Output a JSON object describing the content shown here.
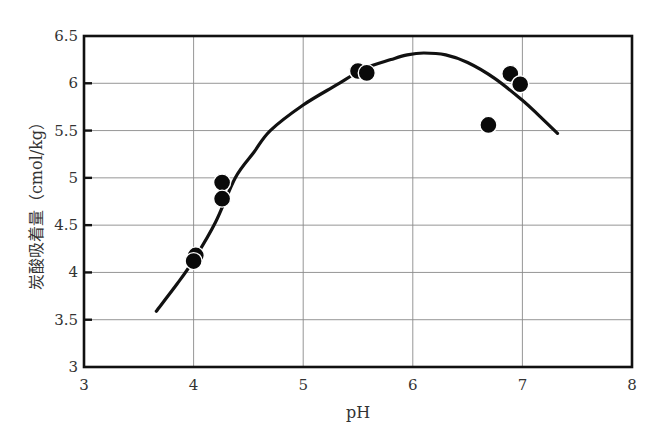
{
  "chart_data": {
    "type": "scatter",
    "title": "",
    "xlabel": "pH",
    "ylabel": "炭酸吸着量 (cmol/kg)",
    "ylabel_parts": {
      "main": "炭酸吸着量",
      "unit": "（cmol/kg）"
    },
    "xlim": [
      3,
      8
    ],
    "ylim": [
      3,
      6.5
    ],
    "x_ticks": [
      3,
      4,
      5,
      6,
      7,
      8
    ],
    "x_tick_labels": [
      "3",
      "4",
      "5",
      "6",
      "7",
      "8"
    ],
    "y_ticks": [
      3,
      3.5,
      4,
      4.5,
      5,
      5.5,
      6,
      6.5
    ],
    "y_tick_labels": [
      "3",
      "3.5",
      "4",
      "4.5",
      "5",
      "5.5",
      "6",
      "6.5"
    ],
    "grid": true,
    "legend": null,
    "series": [
      {
        "name": "measured",
        "kind": "scatter",
        "marker": "filled-circle",
        "color": "#0a0a0a",
        "points": [
          {
            "x": 4.02,
            "y": 4.18
          },
          {
            "x": 4.0,
            "y": 4.12
          },
          {
            "x": 4.26,
            "y": 4.95
          },
          {
            "x": 4.26,
            "y": 4.78
          },
          {
            "x": 5.5,
            "y": 6.13
          },
          {
            "x": 5.58,
            "y": 6.11
          },
          {
            "x": 6.69,
            "y": 5.56
          },
          {
            "x": 6.89,
            "y": 6.1
          },
          {
            "x": 6.98,
            "y": 5.99
          }
        ]
      },
      {
        "name": "fitted curve",
        "kind": "line",
        "color": "#111111",
        "points": [
          {
            "x": 3.66,
            "y": 3.59
          },
          {
            "x": 3.85,
            "y": 3.88
          },
          {
            "x": 4.0,
            "y": 4.13
          },
          {
            "x": 4.2,
            "y": 4.53
          },
          {
            "x": 4.38,
            "y": 5.0
          },
          {
            "x": 4.55,
            "y": 5.27
          },
          {
            "x": 4.7,
            "y": 5.5
          },
          {
            "x": 5.0,
            "y": 5.77
          },
          {
            "x": 5.3,
            "y": 5.98
          },
          {
            "x": 5.55,
            "y": 6.15
          },
          {
            "x": 5.8,
            "y": 6.25
          },
          {
            "x": 5.95,
            "y": 6.3
          },
          {
            "x": 6.1,
            "y": 6.32
          },
          {
            "x": 6.3,
            "y": 6.3
          },
          {
            "x": 6.5,
            "y": 6.22
          },
          {
            "x": 6.75,
            "y": 6.05
          },
          {
            "x": 7.0,
            "y": 5.82
          },
          {
            "x": 7.15,
            "y": 5.66
          },
          {
            "x": 7.32,
            "y": 5.47
          }
        ]
      }
    ]
  },
  "plot_area": {
    "left": 84,
    "top": 36,
    "right": 632,
    "bottom": 367
  },
  "colors": {
    "frame": "#111111",
    "grid": "#8a8a8a",
    "text": "#333333",
    "marker": "#0a0a0a",
    "background": "#ffffff"
  }
}
